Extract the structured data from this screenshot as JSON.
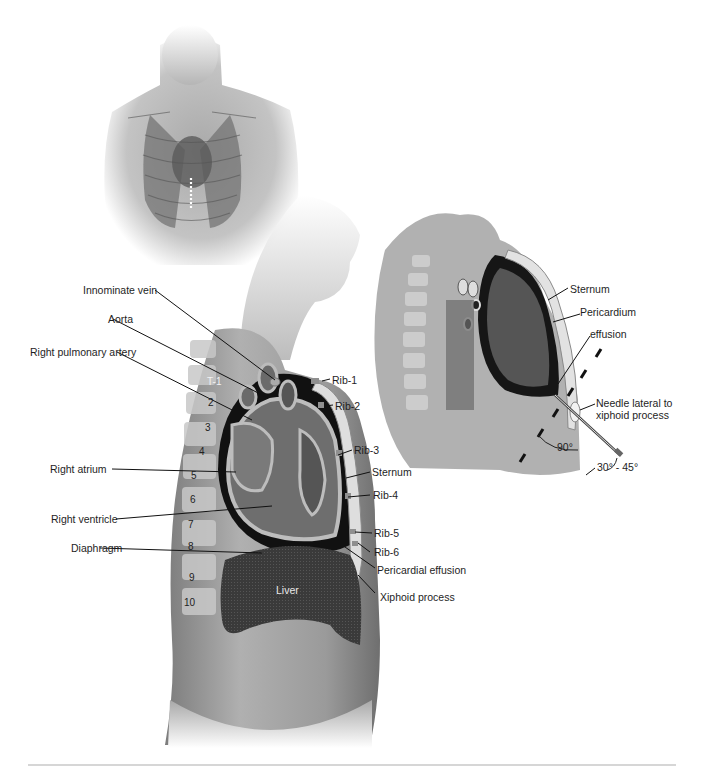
{
  "figure": {
    "topic": "Pericardiocentesis - sagittal anatomy and subxiphoid needle approach",
    "panels": [
      {
        "id": "frontal-torso",
        "description": "Frontal view of male torso with ribcage, lungs and heart; dotted line marking sternum/xiphoid"
      },
      {
        "id": "sagittal-main",
        "description": "Sagittal section of chest showing heart, pericardial effusion, ribs, sternum, liver"
      },
      {
        "id": "sagittal-needle",
        "description": "Sagittal section showing needle insertion lateral to xiphoid process"
      }
    ]
  },
  "main_labels": {
    "innominate_vein": "Innominate vein",
    "aorta": "Aorta",
    "right_pulmonary_artery": "Right pulmonary artery",
    "right_atrium": "Right atrium",
    "right_ventricle": "Right ventricle",
    "diaphragm": "Diaphragm",
    "rib1": "Rib-1",
    "rib2": "Rib-2",
    "rib3": "Rib-3",
    "sternum": "Sternum",
    "rib4": "Rib-4",
    "rib5": "Rib-5",
    "rib6": "Rib-6",
    "pericardial_effusion": "Pericardial effusion",
    "xiphoid_process": "Xiphoid process",
    "liver": "Liver"
  },
  "vertebrae": [
    "T-1",
    "2",
    "3",
    "4",
    "5",
    "6",
    "7",
    "8",
    "9",
    "10"
  ],
  "needle_panel_labels": {
    "sternum": "Sternum",
    "pericardium": "Pericardium",
    "effusion": "effusion",
    "needle_line1": "Needle lateral to",
    "needle_line2": "xiphoid process",
    "angle_90": "90°",
    "angle_range": "30° - 45°"
  },
  "colors": {
    "background": "#ffffff",
    "skin_dark": "#8a8a8a",
    "skin_light": "#cfcfcf",
    "pericardial_space": "#111111",
    "heart_tissue": "#6e6e6e",
    "heart_wall": "#b8b8b8",
    "liver": "#3a3a3a",
    "rule": "#d6d6d6"
  }
}
